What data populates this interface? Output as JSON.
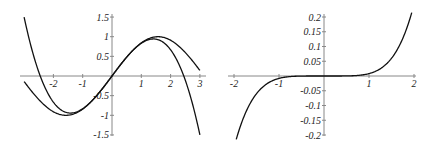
{
  "chart_data": [
    {
      "type": "line",
      "title": "",
      "xlabel": "",
      "ylabel": "",
      "xlim": [
        -3,
        3
      ],
      "ylim": [
        -1.5,
        1.5
      ],
      "grid": false,
      "x_ticks": [
        "-2",
        "-1",
        "1",
        "2",
        "3"
      ],
      "y_ticks": [
        "1.5",
        "1",
        "0.5",
        "-0.5",
        "-1",
        "-1.5"
      ],
      "x_tick_values": [
        -2,
        -1,
        1,
        2,
        3
      ],
      "y_tick_values": [
        1.5,
        1,
        0.5,
        -0.5,
        -1,
        -1.5
      ],
      "series": [
        {
          "name": "sin(x)",
          "x": [
            -3,
            -2,
            -1.57,
            -1,
            0,
            1,
            1.57,
            2,
            3
          ],
          "values": [
            -0.14,
            -0.91,
            -1.0,
            -0.84,
            0,
            0.84,
            1.0,
            0.91,
            0.14
          ]
        },
        {
          "name": "x - x^3/6",
          "x": [
            -3,
            -2.45,
            -2,
            -1.41,
            -1,
            0,
            1,
            1.41,
            2,
            2.45,
            3
          ],
          "values": [
            1.5,
            0,
            -0.67,
            -0.94,
            -0.83,
            0,
            0.83,
            0.94,
            0.67,
            0,
            -1.5
          ]
        }
      ]
    },
    {
      "type": "line",
      "title": "",
      "xlabel": "",
      "ylabel": "",
      "xlim": [
        -2,
        2
      ],
      "ylim": [
        -0.2,
        0.2
      ],
      "grid": false,
      "x_ticks": [
        "-2",
        "-1",
        "1",
        "2"
      ],
      "y_ticks": [
        "0.2",
        "0.15",
        "0.1",
        "0.05",
        "-0.05",
        "-0.1",
        "-0.15",
        "-0.2"
      ],
      "x_tick_values": [
        -2,
        -1,
        1,
        2
      ],
      "y_tick_values": [
        0.2,
        0.15,
        0.1,
        0.05,
        -0.05,
        -0.1,
        -0.15,
        -0.2
      ],
      "series": [
        {
          "name": "sin(x) - (x - x^3/6)",
          "x": [
            -1.95,
            -1.5,
            -1,
            -0.5,
            0,
            0.5,
            1,
            1.5,
            1.95
          ],
          "values": [
            -0.2,
            -0.06,
            -0.008,
            0,
            0,
            0,
            0.008,
            0.06,
            0.2
          ]
        }
      ]
    }
  ]
}
